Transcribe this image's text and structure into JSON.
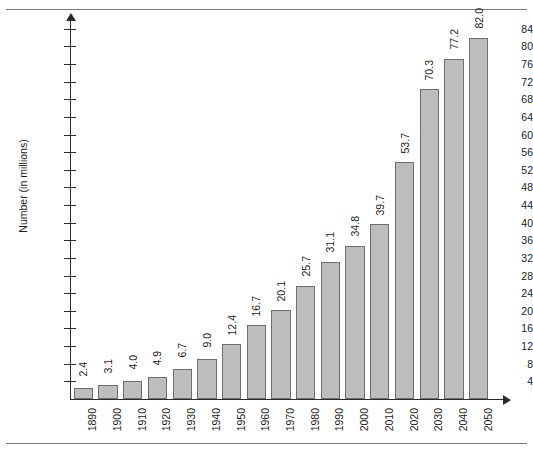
{
  "page": {
    "clipped_caption_fragment": ""
  },
  "chart_data": {
    "type": "bar",
    "title": "",
    "xlabel": "",
    "ylabel": "Number (in millions)",
    "categories": [
      "1890",
      "1900",
      "1910",
      "1920",
      "1930",
      "1940",
      "1950",
      "1960",
      "1970",
      "1980",
      "1990",
      "2000",
      "2010",
      "2020",
      "2030",
      "2040",
      "2050"
    ],
    "values": [
      2.4,
      3.1,
      4.0,
      4.9,
      6.7,
      9.0,
      12.4,
      16.7,
      20.1,
      25.7,
      31.1,
      34.8,
      39.7,
      53.7,
      70.3,
      77.2,
      82.0
    ],
    "value_labels": [
      "2.4",
      "3.1",
      "4.0",
      "4.9",
      "6.7",
      "9.0",
      "12.4",
      "16.7",
      "20.1",
      "25.7",
      "31.1",
      "34.8",
      "39.7",
      "53.7",
      "70.3",
      "77.2",
      "82.0"
    ],
    "ylim": [
      0,
      86
    ],
    "ytick_values": [
      4,
      8,
      12,
      16,
      20,
      24,
      28,
      32,
      36,
      40,
      44,
      48,
      52,
      56,
      60,
      64,
      68,
      72,
      76,
      80,
      84
    ],
    "ytick_labels": [
      "4",
      "8",
      "12",
      "16",
      "20",
      "24",
      "28",
      "32",
      "36",
      "40",
      "44",
      "48",
      "52",
      "56",
      "60",
      "64",
      "68",
      "72",
      "76",
      "80",
      "84"
    ],
    "grid": false,
    "legend": null,
    "bar_color": "#bdbdbd",
    "bar_border_color": "#6e6e6e",
    "axis_color": "#2b2b2b",
    "background_color": "#ffffff"
  }
}
